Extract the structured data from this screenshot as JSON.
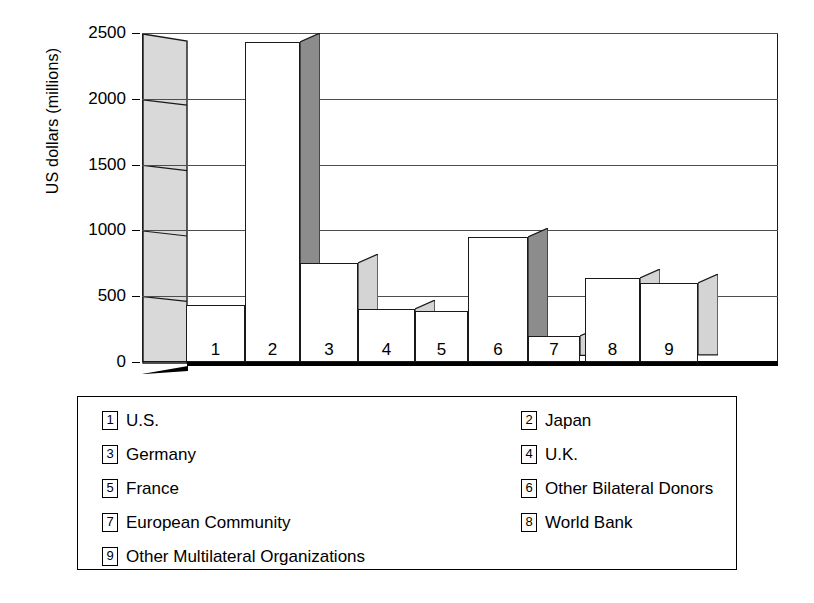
{
  "chart_data": {
    "type": "bar",
    "title": "",
    "xlabel": "",
    "ylabel": "US dollars (millions)",
    "ylim": [
      0,
      2500
    ],
    "yticks": [
      0,
      500,
      1000,
      1500,
      2000,
      2500
    ],
    "ytick_labels": [
      "0",
      "500",
      "1000",
      "1500",
      "2000",
      "2500"
    ],
    "grid": true,
    "legend_position": "below",
    "categories": [
      "U.S.",
      "Japan",
      "Germany",
      "U.K.",
      "France",
      "Other Bilateral Donors",
      "European Community",
      "World Bank",
      "Other Multilateral Organizations"
    ],
    "values": [
      430,
      2430,
      750,
      400,
      390,
      950,
      200,
      640,
      600
    ],
    "bar_labels": [
      "1",
      "2",
      "3",
      "4",
      "5",
      "6",
      "7",
      "8",
      "9"
    ]
  },
  "axis": {
    "ylabel": "US dollars (millions)",
    "ticks": [
      {
        "label": "2500",
        "value": 2500
      },
      {
        "label": "2000",
        "value": 2000
      },
      {
        "label": "1500",
        "value": 1500
      },
      {
        "label": "1000",
        "value": 1000
      },
      {
        "label": "500",
        "value": 500
      },
      {
        "label": "0",
        "value": 0
      }
    ]
  },
  "bars": [
    {
      "key": "1",
      "name": "U.S.",
      "value": 430
    },
    {
      "key": "2",
      "name": "Japan",
      "value": 2430
    },
    {
      "key": "3",
      "name": "Germany",
      "value": 750
    },
    {
      "key": "4",
      "name": "U.K.",
      "value": 400
    },
    {
      "key": "5",
      "name": "France",
      "value": 390
    },
    {
      "key": "6",
      "name": "Other Bilateral Donors",
      "value": 950
    },
    {
      "key": "7",
      "name": "European Community",
      "value": 200
    },
    {
      "key": "8",
      "name": "World Bank",
      "value": 640
    },
    {
      "key": "9",
      "name": "Other Multilateral Organizations",
      "value": 600
    }
  ],
  "legend": {
    "entries": [
      {
        "key": "1",
        "label": "U.S."
      },
      {
        "key": "2",
        "label": "Japan"
      },
      {
        "key": "3",
        "label": "Germany"
      },
      {
        "key": "4",
        "label": "U.K."
      },
      {
        "key": "5",
        "label": "France"
      },
      {
        "key": "6",
        "label": "Other Bilateral Donors"
      },
      {
        "key": "7",
        "label": "European Community"
      },
      {
        "key": "8",
        "label": "World Bank"
      },
      {
        "key": "9",
        "label": "Other Multilateral Organizations"
      }
    ]
  },
  "colors": {
    "bar_front": "#ffffff",
    "bar_side_light": "#d4d4d4",
    "bar_side_dark": "#8c8c8c",
    "wall": "#d9d9d9",
    "outline": "#1a1a1a",
    "gridline": "#4d4d4d",
    "floor": "#000000"
  }
}
